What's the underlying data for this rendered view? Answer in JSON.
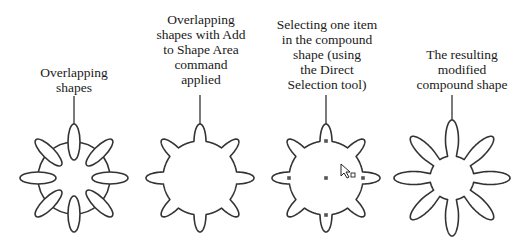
{
  "figure": {
    "panels": [
      {
        "id": "overlapping",
        "caption": "Overlapping\nshapes",
        "state": "separate-shapes"
      },
      {
        "id": "add-to-shape-area",
        "caption": "Overlapping\nshapes with Add\nto Shape Area\ncommand\napplied",
        "state": "unioned"
      },
      {
        "id": "direct-selection",
        "caption": "Selecting one item\nin the compound\nshape (using\nthe Direct\nSelection tool)",
        "state": "circle-selected"
      },
      {
        "id": "result",
        "caption": "The resulting\nmodified\ncompound shape",
        "state": "modified"
      }
    ],
    "stroke_color": "#333333",
    "petal_count": 8
  }
}
